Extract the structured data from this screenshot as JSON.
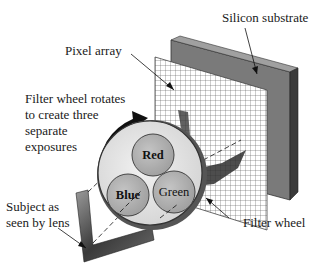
{
  "diagram": {
    "labels": {
      "silicon_substrate": "Silicon substrate",
      "pixel_array": "Pixel array",
      "filter_wheel_note_line1": "Filter wheel rotates",
      "filter_wheel_note_line2": "to create three",
      "filter_wheel_note_line3": "separate",
      "filter_wheel_note_line4": "exposures",
      "subject_line1": "Subject as",
      "subject_line2": "seen by lens",
      "filter_wheel": "Filter wheel"
    },
    "filters": {
      "red": "Red",
      "blue": "Blue",
      "green": "Green"
    },
    "colors": {
      "substrate_face": "#7a7a7a",
      "substrate_side": "#3c3c3c",
      "substrate_top": "#9a9a9a",
      "grid_line": "#555555",
      "wheel_fill": "#e6e6e6",
      "filter_fill": "#b4b4b4",
      "text": "#1a1a1a"
    }
  }
}
